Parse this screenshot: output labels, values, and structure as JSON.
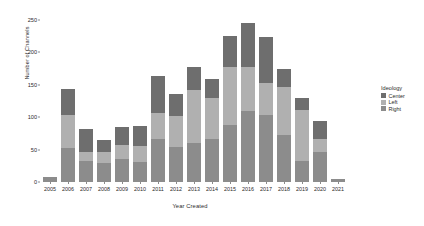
{
  "chart_data": {
    "type": "bar",
    "stacked": true,
    "title": "",
    "xlabel": "Year Created",
    "ylabel": "Number of Channels",
    "categories": [
      "2005",
      "2006",
      "2007",
      "2008",
      "2009",
      "2010",
      "2011",
      "2012",
      "2013",
      "2014",
      "2015",
      "2016",
      "2017",
      "2018",
      "2019",
      "2020",
      "2021"
    ],
    "series": [
      {
        "name": "Right",
        "color": "#8c8c8c",
        "values": [
          7,
          53,
          32,
          30,
          36,
          31,
          67,
          54,
          60,
          67,
          88,
          110,
          103,
          72,
          33,
          47,
          4
        ]
      },
      {
        "name": "Left",
        "color": "#b0b0b0",
        "values": [
          0,
          50,
          15,
          17,
          21,
          24,
          39,
          47,
          82,
          63,
          90,
          68,
          50,
          75,
          78,
          20,
          0
        ]
      },
      {
        "name": "Center",
        "color": "#6e6e6e",
        "values": [
          0,
          40,
          34,
          18,
          28,
          32,
          57,
          34,
          35,
          29,
          47,
          67,
          70,
          27,
          18,
          27,
          0
        ]
      }
    ],
    "totals": [
      7,
      143,
      81,
      65,
      85,
      87,
      163,
      135,
      177,
      159,
      225,
      245,
      223,
      174,
      129,
      94,
      4
    ],
    "ylim": [
      0,
      262
    ],
    "yticks": [
      0,
      50,
      100,
      150,
      200,
      250
    ],
    "ytick_labels": [
      "0",
      "50",
      "100",
      "150",
      "200",
      "250"
    ],
    "grid": false,
    "legend": {
      "title": "Ideology",
      "position": "right",
      "entries": [
        {
          "label": "Center",
          "color": "#6e6e6e"
        },
        {
          "label": "Left",
          "color": "#b0b0b0"
        },
        {
          "label": "Right",
          "color": "#8c8c8c"
        }
      ]
    }
  }
}
